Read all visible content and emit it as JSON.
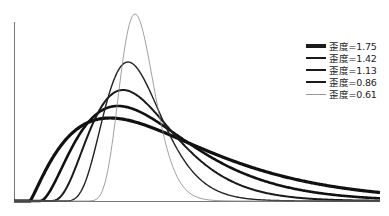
{
  "chart_data": {
    "type": "line",
    "title": "",
    "xlabel": "",
    "ylabel": "",
    "grid": false,
    "legend_position": "upper right",
    "axes": {
      "x_visible": true,
      "y_visible": true,
      "ticks": false
    },
    "series": [
      {
        "name": "歪度=1.75",
        "skewness": 1.75,
        "line_width": 3.2,
        "color": "#111111",
        "peak": {
          "x_px": 110,
          "y_px": 118
        }
      },
      {
        "name": "歪度=1.42",
        "skewness": 1.42,
        "line_width": 2.6,
        "color": "#111111",
        "peak": {
          "x_px": 118,
          "y_px": 106
        }
      },
      {
        "name": "歪度=1.13",
        "skewness": 1.13,
        "line_width": 2.0,
        "color": "#1a1a1a",
        "peak": {
          "x_px": 123,
          "y_px": 90
        }
      },
      {
        "name": "歪度=0.86",
        "skewness": 0.86,
        "line_width": 1.4,
        "color": "#222222",
        "peak": {
          "x_px": 128,
          "y_px": 62
        }
      },
      {
        "name": "歪度=0.61",
        "skewness": 0.61,
        "line_width": 0.8,
        "color": "#888888",
        "peak": {
          "x_px": 135,
          "y_px": 14
        }
      }
    ]
  },
  "legend": {
    "items": [
      {
        "label": "歪度=1.75"
      },
      {
        "label": "歪度=1.42"
      },
      {
        "label": "歪度=1.13"
      },
      {
        "label": "歪度=0.86"
      },
      {
        "label": "歪度=0.61"
      }
    ]
  }
}
